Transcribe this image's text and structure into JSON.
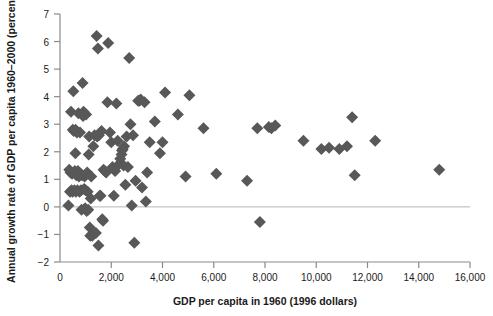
{
  "chart_data": {
    "type": "scatter",
    "title": "",
    "xlabel": "GDP per capita in 1960 (1996 dollars)",
    "ylabel": "Annual growth rate of GDP per capita 1960–2000 (percent)",
    "xlim": [
      0,
      16000
    ],
    "ylim": [
      -2,
      7
    ],
    "xticks": [
      0,
      2000,
      4000,
      6000,
      8000,
      10000,
      12000,
      14000,
      16000
    ],
    "xtick_labels": [
      "0",
      "2,000",
      "4,000",
      "6,000",
      "8,000",
      "10,000",
      "12,000",
      "14,000",
      "16,000"
    ],
    "yticks": [
      -2,
      -1,
      0,
      1,
      2,
      3,
      4,
      5,
      6,
      7
    ],
    "ytick_labels": [
      "−2",
      "−1",
      "0",
      "1",
      "2",
      "3",
      "4",
      "5",
      "6",
      "7"
    ],
    "grid": false,
    "zero_line": true,
    "marker": "diamond",
    "marker_color": "#585858",
    "marker_size": 6,
    "axis_color": "#8a8a8a",
    "legend": null,
    "points": [
      [
        330,
        0.05
      ],
      [
        360,
        1.35
      ],
      [
        390,
        0.55
      ],
      [
        410,
        1.25
      ],
      [
        430,
        3.45
      ],
      [
        450,
        0.6
      ],
      [
        470,
        1.2
      ],
      [
        490,
        0.55
      ],
      [
        500,
        2.8
      ],
      [
        520,
        4.2
      ],
      [
        540,
        2.75
      ],
      [
        560,
        0.6
      ],
      [
        580,
        1.3
      ],
      [
        600,
        1.95
      ],
      [
        610,
        2.8
      ],
      [
        620,
        0.55
      ],
      [
        640,
        1.15
      ],
      [
        660,
        2.7
      ],
      [
        680,
        0.6
      ],
      [
        700,
        1.3
      ],
      [
        720,
        3.4
      ],
      [
        740,
        1.1
      ],
      [
        760,
        0.55
      ],
      [
        780,
        2.7
      ],
      [
        800,
        1.2
      ],
      [
        820,
        0.6
      ],
      [
        840,
        -0.1
      ],
      [
        860,
        1.15
      ],
      [
        880,
        4.5
      ],
      [
        900,
        3.3
      ],
      [
        920,
        3.45
      ],
      [
        940,
        0.65
      ],
      [
        960,
        1.1
      ],
      [
        980,
        -0.05
      ],
      [
        1000,
        0.6
      ],
      [
        1020,
        3.35
      ],
      [
        1040,
        -0.15
      ],
      [
        1060,
        1.25
      ],
      [
        1080,
        0.55
      ],
      [
        1100,
        -0.1
      ],
      [
        1120,
        1.9
      ],
      [
        1140,
        2.55
      ],
      [
        1160,
        -0.75
      ],
      [
        1180,
        -1.05
      ],
      [
        1200,
        0.3
      ],
      [
        1220,
        1.1
      ],
      [
        1240,
        -1.0
      ],
      [
        1260,
        -1.05
      ],
      [
        1300,
        2.2
      ],
      [
        1350,
        2.6
      ],
      [
        1400,
        -0.95
      ],
      [
        1430,
        6.2
      ],
      [
        1450,
        2.55
      ],
      [
        1480,
        5.75
      ],
      [
        1500,
        -1.4
      ],
      [
        1520,
        2.6
      ],
      [
        1550,
        0.4
      ],
      [
        1580,
        0.4
      ],
      [
        1620,
        2.75
      ],
      [
        1650,
        -0.45
      ],
      [
        1680,
        -0.5
      ],
      [
        1700,
        1.35
      ],
      [
        1750,
        1.3
      ],
      [
        1800,
        1.25
      ],
      [
        1850,
        3.8
      ],
      [
        1880,
        5.95
      ],
      [
        1950,
        2.7
      ],
      [
        2000,
        2.35
      ],
      [
        2050,
        1.45
      ],
      [
        2100,
        0.4
      ],
      [
        2150,
        1.3
      ],
      [
        2200,
        3.75
      ],
      [
        2250,
        2.4
      ],
      [
        2300,
        1.55
      ],
      [
        2350,
        1.75
      ],
      [
        2400,
        1.9
      ],
      [
        2420,
        2.05
      ],
      [
        2450,
        2.1
      ],
      [
        2480,
        1.5
      ],
      [
        2500,
        2.2
      ],
      [
        2550,
        0.8
      ],
      [
        2600,
        2.55
      ],
      [
        2650,
        1.45
      ],
      [
        2700,
        5.4
      ],
      [
        2750,
        3.0
      ],
      [
        2800,
        0.05
      ],
      [
        2850,
        2.6
      ],
      [
        2900,
        -1.3
      ],
      [
        2950,
        0.95
      ],
      [
        3050,
        3.85
      ],
      [
        3100,
        3.85
      ],
      [
        3150,
        3.9
      ],
      [
        3200,
        0.7
      ],
      [
        3300,
        3.8
      ],
      [
        3350,
        0.2
      ],
      [
        3400,
        1.25
      ],
      [
        3500,
        2.35
      ],
      [
        3700,
        3.1
      ],
      [
        3900,
        1.95
      ],
      [
        4000,
        2.35
      ],
      [
        4100,
        4.15
      ],
      [
        4600,
        3.35
      ],
      [
        4900,
        1.1
      ],
      [
        5050,
        4.05
      ],
      [
        5600,
        2.85
      ],
      [
        6100,
        1.2
      ],
      [
        7300,
        0.95
      ],
      [
        7700,
        2.85
      ],
      [
        7800,
        -0.55
      ],
      [
        8150,
        2.9
      ],
      [
        8250,
        2.85
      ],
      [
        8400,
        2.95
      ],
      [
        9500,
        2.4
      ],
      [
        10200,
        2.1
      ],
      [
        10500,
        2.15
      ],
      [
        10900,
        2.1
      ],
      [
        11200,
        2.2
      ],
      [
        11400,
        3.25
      ],
      [
        11500,
        1.15
      ],
      [
        12300,
        2.4
      ],
      [
        14800,
        1.35
      ]
    ]
  }
}
